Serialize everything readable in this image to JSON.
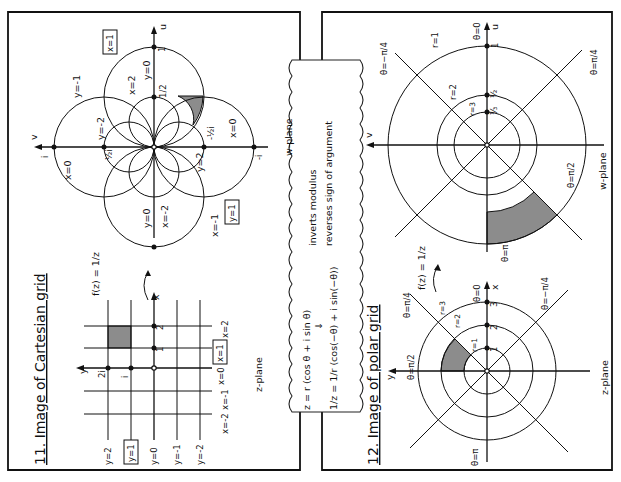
{
  "page": {
    "orientation": "rotated 90 degrees counter-clockwise",
    "ink_color": "#111111",
    "shade_color": "#8c8c8c"
  },
  "section11": {
    "title": "11. Image of Cartesian grid",
    "mapping_label": "f(z) = 1/z",
    "z_plane": {
      "plane_label": "z-plane",
      "axis_x": "x",
      "axis_y": "y",
      "vertical_line_labels": [
        "x=-2",
        "x=-1",
        "x=0",
        "x=1",
        "x=2"
      ],
      "horizontal_line_labels": [
        "y=2",
        "y=1",
        "y=0",
        "y=-1",
        "y=-2"
      ],
      "boxed_labels": [
        "x=1",
        "y=1"
      ],
      "tick_labels": [
        "1",
        "2",
        "i",
        "2i"
      ]
    },
    "w_plane": {
      "plane_label": "w-plane",
      "axis_u": "u",
      "axis_v": "v",
      "tick_labels": [
        "1",
        "1/2",
        "i",
        "½i",
        "-½i",
        "-i",
        "-1"
      ],
      "curve_labels": [
        "x=1",
        "x=2",
        "x=0",
        "x=0",
        "x=-1",
        "x=-2",
        "y=0",
        "y=0",
        "y=-1",
        "y=-2",
        "y=2",
        "y=1"
      ],
      "boxed_labels": [
        "x=1",
        "y=1"
      ]
    }
  },
  "callout": {
    "line1": "z = r (cos θ + i sin θ)",
    "arrow": "⇓",
    "line2": "1/z = 1/r (cos(−θ) + i sin(−θ))",
    "note1": "inverts modulus",
    "note2": "reverses sign of argument"
  },
  "section12": {
    "title": "12. Image of polar grid",
    "mapping_label": "f(z) = 1/z",
    "z_plane": {
      "plane_label": "z-plane",
      "axis_x": "x",
      "axis_y": "y",
      "circle_labels": [
        "r=1",
        "r=2",
        "r=3"
      ],
      "ray_labels": [
        "θ=0",
        "θ=π/4",
        "θ=π/2",
        "θ=π",
        "θ=−π/4"
      ],
      "tick_labels": [
        "1",
        "2",
        "3"
      ]
    },
    "w_plane": {
      "plane_label": "w-plane",
      "axis_u": "u",
      "axis_v": "v",
      "circle_labels": [
        "r=1",
        "r=2",
        "r=3"
      ],
      "ray_labels": [
        "θ=0",
        "θ=−π/4",
        "θ=π/4",
        "θ=π/2",
        "θ=π"
      ],
      "tick_labels": [
        "1",
        "½",
        "⅓"
      ]
    }
  }
}
